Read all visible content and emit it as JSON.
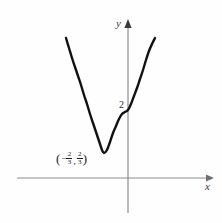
{
  "figure": {
    "background_color": "#fefefe",
    "axis_color": "#8c8c8c",
    "curve_color": "#111111",
    "text_color": "#1c1c1c"
  },
  "axes": {
    "x_label": "x",
    "y_label": "y"
  },
  "annotations": {
    "y_intercept_label": "2",
    "vertex": {
      "open_paren": "(",
      "minus_sign": "−",
      "x_numerator": "2",
      "x_denominator": "3",
      "comma": ",",
      "y_numerator": "2",
      "y_denominator": "3",
      "close_paren": ")"
    }
  },
  "chart_data": {
    "type": "line",
    "title": "",
    "xlabel": "x",
    "ylabel": "y",
    "grid": false,
    "legend": null,
    "curve_name": "parabola",
    "vertex": [
      -0.6667,
      0.6667
    ],
    "y_intercept": 2,
    "annotations": [
      {
        "text": "2",
        "x": 0,
        "y": 2
      },
      {
        "text": "(-2/3, 2/3)",
        "x": -0.6667,
        "y": 0.6667
      }
    ],
    "axis_origin_px": [
      128,
      178
    ],
    "pixel_points": [
      [
        66,
        38
      ],
      [
        69,
        48
      ],
      [
        72,
        58
      ],
      [
        75,
        67
      ],
      [
        78,
        76
      ],
      [
        81,
        85
      ],
      [
        84,
        95
      ],
      [
        87,
        104
      ],
      [
        90,
        114
      ],
      [
        93,
        123
      ],
      [
        96,
        132
      ],
      [
        99,
        141
      ],
      [
        102,
        150
      ],
      [
        104,
        153
      ],
      [
        107,
        150
      ],
      [
        110,
        142
      ],
      [
        113,
        133
      ],
      [
        116,
        126
      ],
      [
        119,
        119
      ],
      [
        122,
        114
      ],
      [
        125,
        112
      ],
      [
        128,
        110
      ],
      [
        131,
        104
      ],
      [
        134,
        96
      ],
      [
        137,
        88
      ],
      [
        140,
        79
      ],
      [
        143,
        70
      ],
      [
        146,
        60
      ],
      [
        149,
        51
      ],
      [
        152,
        44
      ],
      [
        155,
        38
      ]
    ]
  }
}
